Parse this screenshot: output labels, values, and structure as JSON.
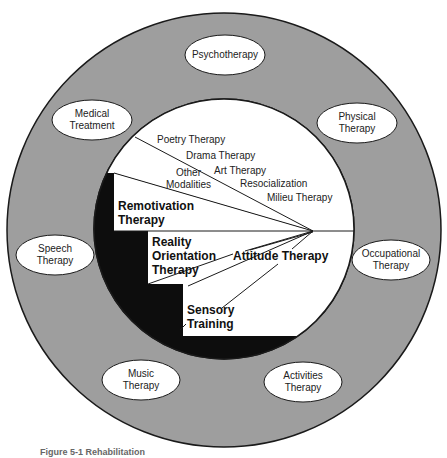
{
  "diagram": {
    "outer_ring": {
      "label": "Adjunct treatment modalities",
      "fill": "#9e9e9e",
      "items": [
        {
          "label": "Psychotherapy"
        },
        {
          "label": "Medical\nTreatment"
        },
        {
          "label": "Physical\nTherapy"
        },
        {
          "label": "Speech\nTherapy"
        },
        {
          "label": "Occupational\nTherapy"
        },
        {
          "label": "Music\nTherapy"
        },
        {
          "label": "Activities\nTherapy"
        }
      ]
    },
    "inner_circle": {
      "upper_items": [
        {
          "label": "Poetry Therapy"
        },
        {
          "label": "Drama Therapy"
        },
        {
          "label": "Art Therapy"
        },
        {
          "label": "Resocialization"
        },
        {
          "label": "Milieu Therapy"
        },
        {
          "label": "Other\nModalities"
        }
      ],
      "steps": [
        {
          "label": "Remotivation\nTherapy"
        },
        {
          "label": "Reality\nOrientation\nTherapy"
        },
        {
          "label": "Sensory\nTraining"
        }
      ],
      "center_label": "Attitude Therapy",
      "shadow_fill": "#0d0d0d"
    },
    "caption": "Figure 5-1 Rehabilitation"
  }
}
